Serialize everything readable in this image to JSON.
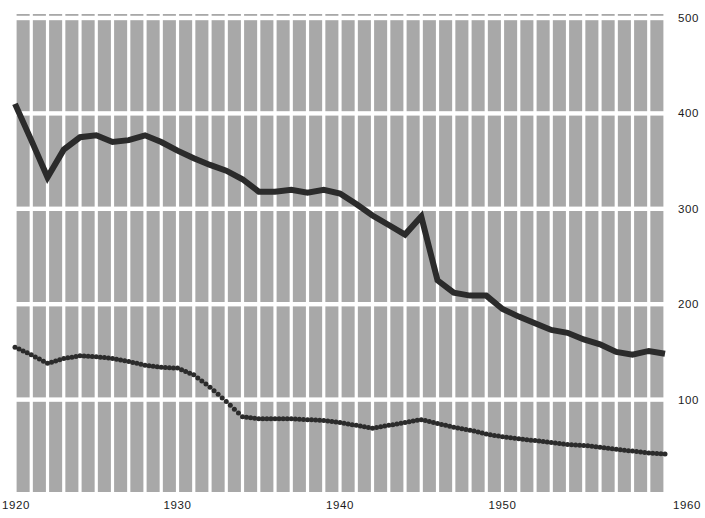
{
  "chart_data": {
    "type": "line",
    "title": "",
    "subtitle": "",
    "xlabel": "",
    "ylabel": "",
    "xlim": [
      1920,
      1960
    ],
    "ylim": [
      0,
      500
    ],
    "grid": true,
    "grid_style": "white gridlines on gray plot background; vertical line every year, horizontal line every 100 units",
    "legend": "none",
    "legend_position": "none",
    "x_ticks": [
      1920,
      1930,
      1940,
      1950,
      1960
    ],
    "x_tick_labels": [
      "1920",
      "1930",
      "1940",
      "1950",
      "1960"
    ],
    "y_ticks": [
      100,
      200,
      300,
      400,
      500
    ],
    "y_tick_labels": [
      "100",
      "200",
      "300",
      "400",
      "500"
    ],
    "y_axis_side": "right",
    "plot_background": "#a8a8a8",
    "gridline_color": "#ffffff",
    "series": [
      {
        "name": "solid-series",
        "style": "solid",
        "color": "#2b2b2b",
        "linewidth": 6,
        "x": [
          1920,
          1921,
          1922,
          1923,
          1924,
          1925,
          1926,
          1927,
          1928,
          1929,
          1930,
          1931,
          1932,
          1933,
          1934,
          1935,
          1936,
          1937,
          1938,
          1939,
          1940,
          1941,
          1942,
          1943,
          1944,
          1945,
          1946,
          1947,
          1948,
          1949,
          1950,
          1951,
          1952,
          1953,
          1954,
          1955,
          1956,
          1957,
          1958,
          1959,
          1960
        ],
        "values": [
          410,
          372,
          333,
          362,
          375,
          377,
          370,
          372,
          377,
          370,
          361,
          353,
          346,
          340,
          331,
          318,
          318,
          320,
          317,
          320,
          316,
          305,
          293,
          283,
          273,
          292,
          225,
          212,
          209,
          209,
          195,
          187,
          180,
          173,
          170,
          163,
          158,
          150,
          147,
          151,
          148
        ]
      },
      {
        "name": "dotted-series",
        "style": "dotted",
        "color": "#2b2b2b",
        "linewidth": 5,
        "x": [
          1920,
          1921,
          1922,
          1923,
          1924,
          1925,
          1926,
          1927,
          1928,
          1929,
          1930,
          1931,
          1932,
          1933,
          1934,
          1935,
          1936,
          1937,
          1938,
          1939,
          1940,
          1941,
          1942,
          1943,
          1944,
          1945,
          1946,
          1947,
          1948,
          1949,
          1950,
          1951,
          1952,
          1953,
          1954,
          1955,
          1956,
          1957,
          1958,
          1959,
          1960
        ],
        "values": [
          155,
          147,
          138,
          143,
          146,
          145,
          143,
          140,
          136,
          134,
          133,
          126,
          113,
          98,
          82,
          80,
          80,
          80,
          79,
          78,
          76,
          73,
          70,
          73,
          76,
          79,
          75,
          71,
          68,
          64,
          61,
          59,
          57,
          55,
          53,
          52,
          50,
          48,
          46,
          44,
          43
        ]
      }
    ],
    "annotations": []
  },
  "geometry": {
    "plot_left": 15,
    "plot_right": 665,
    "plot_top": 14,
    "plot_bottom": 492,
    "value_500_y": 18,
    "value_0_y": 495
  }
}
